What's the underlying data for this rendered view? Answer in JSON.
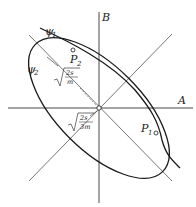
{
  "labels": {
    "axis_a": "A",
    "axis_b": "B",
    "psi1": "ψ",
    "psi1_sub": "1",
    "psi2": "ψ",
    "psi2_sub": "2",
    "p1": "P",
    "p1_sub": "1",
    "p2": "P",
    "p2_sub": "2",
    "radius_outer_num": "2s",
    "radius_outer_den": "m",
    "radius_inner_num": "2s",
    "radius_inner_den": "3m"
  },
  "colors": {
    "stroke": "#1a1a1a",
    "background": "#ffffff"
  }
}
